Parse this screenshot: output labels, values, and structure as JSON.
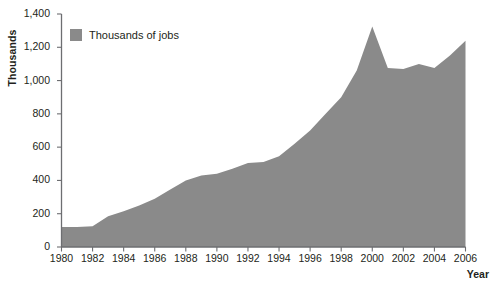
{
  "chart_data": {
    "type": "area",
    "title": "",
    "xlabel": "Year",
    "ylabel": "Thousands",
    "legend": [
      "Thousands of jobs"
    ],
    "legend_position": "inside-top-left",
    "grid": false,
    "series_color": "#8a8a8a",
    "xlim": [
      1980,
      2006
    ],
    "ylim": [
      0,
      1400
    ],
    "ytick_labels": [
      "1,400",
      "1,200",
      "1,000",
      "800",
      "600",
      "400",
      "200",
      "0"
    ],
    "ytick_values": [
      1400,
      1200,
      1000,
      800,
      600,
      400,
      200,
      0
    ],
    "xtick_labels": [
      "1980",
      "1982",
      "1984",
      "1986",
      "1988",
      "1990",
      "1992",
      "1994",
      "1996",
      "1998",
      "2000",
      "2002",
      "2004",
      "2006"
    ],
    "xtick_values": [
      1980,
      1982,
      1984,
      1986,
      1988,
      1990,
      1992,
      1994,
      1996,
      1998,
      2000,
      2002,
      2004,
      2006
    ],
    "x": [
      1980,
      1981,
      1982,
      1983,
      1984,
      1985,
      1986,
      1987,
      1988,
      1989,
      1990,
      1991,
      1992,
      1993,
      1994,
      1995,
      1996,
      1997,
      1998,
      1999,
      2000,
      2001,
      2002,
      2003,
      2004,
      2005,
      2006
    ],
    "values": [
      120,
      120,
      125,
      185,
      215,
      250,
      290,
      345,
      400,
      430,
      440,
      470,
      505,
      510,
      545,
      620,
      700,
      800,
      900,
      1060,
      1325,
      1075,
      1070,
      1100,
      1075,
      1150,
      1240
    ],
    "series": [
      {
        "name": "Thousands of jobs",
        "color": "#8a8a8a",
        "values": [
          120,
          120,
          125,
          185,
          215,
          250,
          290,
          345,
          400,
          430,
          440,
          470,
          505,
          510,
          545,
          620,
          700,
          800,
          900,
          1060,
          1325,
          1075,
          1070,
          1100,
          1075,
          1150,
          1240
        ]
      }
    ]
  },
  "axes": {
    "y_title": "Thousands",
    "x_title": "Year"
  },
  "legend": {
    "entries": [
      {
        "label": "Thousands of jobs",
        "color": "#8a8a8a"
      }
    ]
  },
  "colors": {
    "area": "#8a8a8a",
    "axis": "#6d6e71",
    "text": "#231f20"
  }
}
